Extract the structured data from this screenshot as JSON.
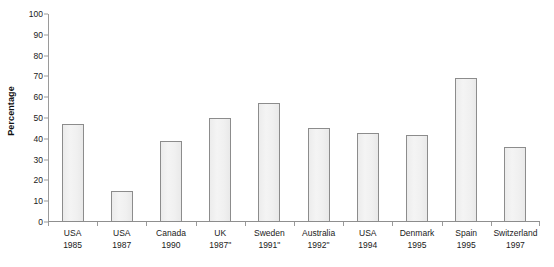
{
  "chart_data": {
    "type": "bar",
    "title": "",
    "xlabel": "",
    "ylabel": "Percentage",
    "ylim": [
      0,
      100
    ],
    "ytick_step": 10,
    "yticks": [
      100,
      90,
      80,
      70,
      60,
      50,
      40,
      30,
      20,
      10,
      0
    ],
    "grid": false,
    "legend": "none",
    "bar_fill_color": "#efefef",
    "bar_border_color": "#8c8c8c",
    "axis_color": "#9a9a9a",
    "background_color": "#ffffff",
    "categories": [
      "USA 1985",
      "USA 1987",
      "Canada 1990",
      "UK 1987\"",
      "Sweden 1991\"",
      "Australia 1992\"",
      "USA 1994",
      "Denmark 1995",
      "Spain 1995",
      "Switzerland 1997"
    ],
    "values": [
      47,
      15,
      39,
      50,
      57,
      45,
      43,
      42,
      69,
      36
    ],
    "points": [
      {
        "country": "USA",
        "year": "1985",
        "mark": "",
        "value": 47
      },
      {
        "country": "USA",
        "year": "1987",
        "mark": "",
        "value": 15
      },
      {
        "country": "Canada",
        "year": "1990",
        "mark": "",
        "value": 39
      },
      {
        "country": "UK",
        "year": "1987",
        "mark": "\"",
        "value": 50
      },
      {
        "country": "Sweden",
        "year": "1991",
        "mark": "\"",
        "value": 57
      },
      {
        "country": "Australia",
        "year": "1992",
        "mark": "\"",
        "value": 45
      },
      {
        "country": "USA",
        "year": "1994",
        "mark": "",
        "value": 43
      },
      {
        "country": "Denmark",
        "year": "1995",
        "mark": "",
        "value": 42
      },
      {
        "country": "Spain",
        "year": "1995",
        "mark": "",
        "value": 69
      },
      {
        "country": "Switzerland",
        "year": "1997",
        "mark": "",
        "value": 36
      }
    ]
  }
}
